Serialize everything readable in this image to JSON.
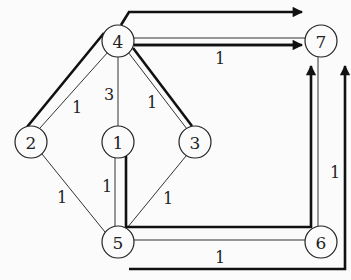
{
  "diagram": {
    "type": "weighted-graph-with-flow-paths",
    "nodes": [
      {
        "id": "1",
        "label": "1"
      },
      {
        "id": "2",
        "label": "2"
      },
      {
        "id": "3",
        "label": "3"
      },
      {
        "id": "4",
        "label": "4"
      },
      {
        "id": "5",
        "label": "5"
      },
      {
        "id": "6",
        "label": "6"
      },
      {
        "id": "7",
        "label": "7"
      }
    ],
    "edges": [
      {
        "from": "4",
        "to": "7",
        "weight": "1"
      },
      {
        "from": "4",
        "to": "2",
        "weight": "1"
      },
      {
        "from": "4",
        "to": "1",
        "weight": "3"
      },
      {
        "from": "4",
        "to": "3",
        "weight": "1"
      },
      {
        "from": "2",
        "to": "5",
        "weight": "1"
      },
      {
        "from": "1",
        "to": "5",
        "weight": "1"
      },
      {
        "from": "3",
        "to": "5",
        "weight": "1"
      },
      {
        "from": "5",
        "to": "6",
        "weight": "1"
      },
      {
        "from": "6",
        "to": "7",
        "weight": "1"
      }
    ],
    "flow_paths": [
      {
        "description": "2 -> 4 -> 7 (bold path along edges, arrow into 7)"
      },
      {
        "description": "3 -> 4 -> above -> 7 (bold arrow over top)"
      },
      {
        "description": "1 -> 5 -> 6 -> 7 (bold path, arrow into 7)"
      },
      {
        "description": "below 5 -> right of 6 -> up to 7 (bold arrow along right)"
      }
    ]
  }
}
